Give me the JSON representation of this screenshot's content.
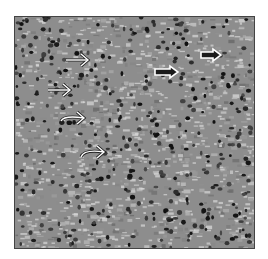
{
  "figure": {
    "background_color": "#8d8d8d",
    "nucleus_color": "#1e1e1e",
    "highlight_color": "#d8d8d8",
    "arrows": [
      {
        "id": 1,
        "style": "line",
        "x1": 66,
        "y1": 60,
        "x2": 88,
        "y2": 60
      },
      {
        "id": 2,
        "style": "line",
        "x1": 48,
        "y1": 90,
        "x2": 70,
        "y2": 90
      },
      {
        "id": 3,
        "style": "curved",
        "x1": 61,
        "y1": 121,
        "x2": 84,
        "y2": 118
      },
      {
        "id": 4,
        "style": "curved",
        "x1": 81,
        "y1": 157,
        "x2": 104,
        "y2": 152
      },
      {
        "id": 5,
        "style": "hollow",
        "x1": 155,
        "y1": 72,
        "x2": 178,
        "y2": 72
      },
      {
        "id": 6,
        "style": "hollow",
        "x1": 201,
        "y1": 55,
        "x2": 221,
        "y2": 55
      }
    ]
  }
}
